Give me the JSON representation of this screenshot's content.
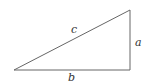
{
  "diagram": {
    "type": "right-triangle",
    "labels": {
      "hypotenuse": "c",
      "vertical_leg": "a",
      "base": "b"
    },
    "colors": {
      "stroke": "#555555",
      "text": "#333333",
      "background": "#ffffff"
    }
  }
}
